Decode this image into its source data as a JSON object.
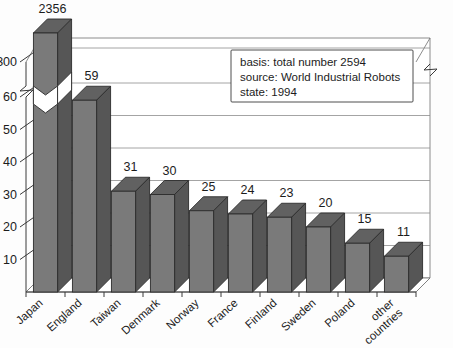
{
  "chart_data": {
    "type": "bar",
    "title": "",
    "subtitle": "",
    "xlabel": "",
    "ylabel": "",
    "categories": [
      "Japan",
      "England",
      "Taiwan",
      "Denmark",
      "Norway",
      "France",
      "Finland",
      "Sweden",
      "Poland",
      "other countries"
    ],
    "values": [
      2356,
      59,
      31,
      30,
      25,
      24,
      23,
      20,
      15,
      11
    ],
    "value_labels": [
      "2356",
      "59",
      "31",
      "30",
      "25",
      "24",
      "23",
      "20",
      "15",
      "11"
    ],
    "ytick_labels": [
      "10",
      "20",
      "30",
      "40",
      "50",
      "60",
      "2300"
    ],
    "ytick_values": [
      10,
      20,
      30,
      40,
      50,
      60,
      2300
    ],
    "ylim": [
      0,
      2356
    ],
    "axis_break": true,
    "axis_break_between": [
      60,
      2300
    ],
    "grid": true,
    "legend_position": "upper-right",
    "style": "3d-bar",
    "bar_color": "#7a7a7a",
    "bar_top_color": "#616161",
    "bar_side_color": "#565656",
    "background_color": "#fdfdfd",
    "annotations": [
      "basis: total number 2594",
      "source: World Industrial Robots",
      "state: 1994"
    ]
  },
  "legend": {
    "line1": "basis: total number 2594",
    "line2": "source: World Industrial Robots",
    "line3": "state: 1994"
  }
}
